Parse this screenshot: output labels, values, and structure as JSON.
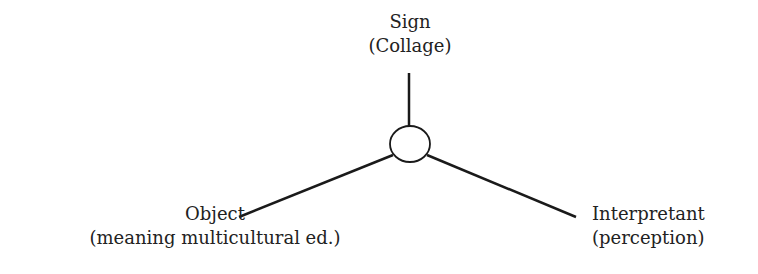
{
  "diagram": {
    "type": "semiotic-triad",
    "nodes": {
      "sign": {
        "title": "Sign",
        "subtitle": "(Collage)"
      },
      "object": {
        "title": "Object",
        "subtitle": "(meaning multicultural ed.)"
      },
      "interpretant": {
        "title": "Interpretant",
        "subtitle": "(perception)"
      }
    },
    "center": "circle-junction",
    "line_color": "#1a1a1a"
  }
}
